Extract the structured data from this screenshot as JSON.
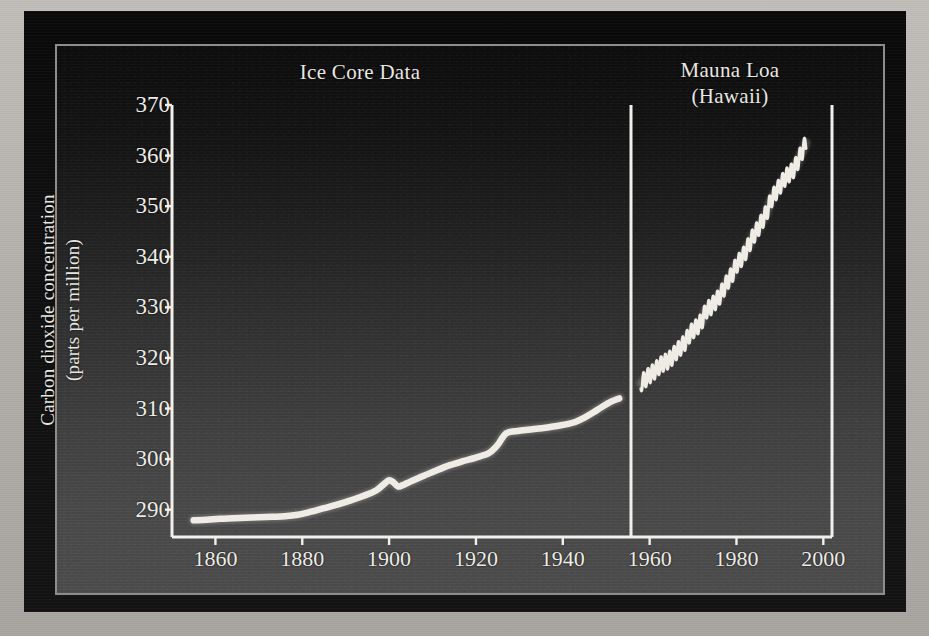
{
  "figure": {
    "y_axis_title_line1": "Carbon dioxide concentration",
    "y_axis_title_line2": "(parts per million)",
    "panel_left_title": "Ice Core Data",
    "panel_right_title_line1": "Mauna Loa",
    "panel_right_title_line2": "(Hawaii)",
    "axis_color": "#f2f0ec",
    "curve_color": "#efece6",
    "plate_color": "#101010",
    "paper_color": "#b9b6b1"
  },
  "chart_data": {
    "type": "line",
    "title": "",
    "subtitle": "",
    "xlabel": "",
    "ylabel": "Carbon dioxide concentration (parts per million)",
    "xlim": [
      1850,
      2002
    ],
    "ylim": [
      284.6,
      370
    ],
    "grid": false,
    "legend_position": "none",
    "yticks": [
      290,
      300,
      310,
      320,
      330,
      340,
      350,
      360,
      370
    ],
    "xticks": [
      1860,
      1880,
      1900,
      1920,
      1940,
      1960,
      1980,
      2000
    ],
    "ytick_labels": [
      "290",
      "300",
      "310",
      "320",
      "330",
      "340",
      "350",
      "360",
      "370"
    ],
    "xtick_labels": [
      "1860",
      "1880",
      "1900",
      "1920",
      "1940",
      "1960",
      "1980",
      "2000"
    ],
    "annotations": [
      {
        "text": "Ice Core Data",
        "x": 1905,
        "y": 368
      },
      {
        "text": "Mauna Loa (Hawaii)",
        "x": 1979,
        "y": 368
      }
    ],
    "series": [
      {
        "name": "Ice Core Data",
        "style": "smooth-line",
        "x": [
          1855,
          1858,
          1861,
          1864,
          1867,
          1870,
          1873,
          1876,
          1879,
          1882,
          1885,
          1888,
          1891,
          1894,
          1897,
          1899,
          1900,
          1901,
          1902,
          1903,
          1905,
          1908,
          1911,
          1914,
          1917,
          1920,
          1923,
          1925,
          1927,
          1930,
          1933,
          1936,
          1939,
          1941,
          1943,
          1945,
          1947,
          1949,
          1951,
          1953
        ],
        "y": [
          287.9,
          288.0,
          288.2,
          288.3,
          288.4,
          288.5,
          288.6,
          288.7,
          289.0,
          289.6,
          290.3,
          291.0,
          291.8,
          292.7,
          293.8,
          295.2,
          295.8,
          295.4,
          294.6,
          294.8,
          295.6,
          296.7,
          297.8,
          298.8,
          299.6,
          300.3,
          301.2,
          302.8,
          305.1,
          305.6,
          305.9,
          306.2,
          306.6,
          306.9,
          307.4,
          308.2,
          309.2,
          310.3,
          311.3,
          312.0
        ]
      },
      {
        "name": "Mauna Loa (Hawaii)",
        "style": "sawtooth-seasonal",
        "start_year": 1958,
        "end_year": 1996,
        "seasonal_amplitude_ppm": 3.2,
        "x": [
          1958,
          1959,
          1960,
          1961,
          1962,
          1963,
          1964,
          1965,
          1966,
          1967,
          1968,
          1969,
          1970,
          1971,
          1972,
          1973,
          1974,
          1975,
          1976,
          1977,
          1978,
          1979,
          1980,
          1981,
          1982,
          1983,
          1984,
          1985,
          1986,
          1987,
          1988,
          1989,
          1990,
          1991,
          1992,
          1993,
          1994,
          1995,
          1996
        ],
        "y": [
          315.0,
          315.8,
          316.6,
          317.3,
          318.2,
          318.9,
          319.3,
          320.0,
          321.1,
          322.0,
          322.9,
          324.4,
          325.5,
          326.2,
          327.3,
          329.4,
          330.0,
          331.0,
          332.0,
          333.6,
          335.2,
          336.5,
          338.4,
          339.5,
          340.8,
          342.6,
          344.3,
          345.6,
          347.2,
          348.9,
          351.3,
          352.7,
          354.0,
          355.4,
          356.3,
          357.0,
          358.6,
          360.6,
          362.5
        ]
      }
    ]
  }
}
